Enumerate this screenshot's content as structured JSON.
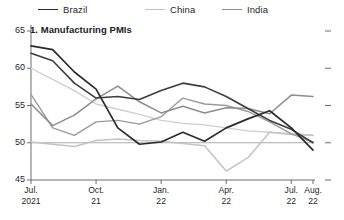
{
  "legend": {
    "items": [
      {
        "label": "Brazil",
        "color": "#2b2b2b",
        "x": 38
      },
      {
        "label": "China",
        "color": "#c3c3c3",
        "x": 145
      },
      {
        "label": "India",
        "color": "#8d8d8d",
        "x": 222
      }
    ]
  },
  "chart_data": {
    "type": "line",
    "title": "1. Manufacturing PMIs",
    "xlabel": "",
    "ylabel": "",
    "ylim": [
      45,
      65
    ],
    "yticks": [
      45,
      50,
      55,
      60,
      65
    ],
    "ytick_labels": [
      "45",
      "50",
      "55",
      "60",
      "65"
    ],
    "grid": false,
    "reference_line": 50,
    "legend_position": "top",
    "x": [
      "Jul. 2021",
      "Aug. 21",
      "Sep. 21",
      "Oct. 21",
      "Nov. 21",
      "Dec. 21",
      "Jan. 22",
      "Feb. 22",
      "Mar. 22",
      "Apr. 22",
      "May 22",
      "Jun. 22",
      "Jul. 22",
      "Aug. 22"
    ],
    "xtick_labels": [
      {
        "top": "Jul.",
        "bottom": "2021",
        "index": 0
      },
      {
        "top": "Oct.",
        "bottom": "21",
        "index": 3
      },
      {
        "top": "Jan.",
        "bottom": "22",
        "index": 6
      },
      {
        "top": "Apr.",
        "bottom": "22",
        "index": 9
      },
      {
        "top": "Jul.",
        "bottom": "22",
        "index": 12
      },
      {
        "top": "Aug.",
        "bottom": "22",
        "index": 13
      }
    ],
    "series": [
      {
        "name": "Brazil",
        "color": "#2b2b2b",
        "width": 1.7,
        "values": [
          63.0,
          62.5,
          59.5,
          57.2,
          52.0,
          49.8,
          50.1,
          51.4,
          50.2,
          52.0,
          53.2,
          54.3,
          52.0,
          49.0
        ]
      },
      {
        "name": "China",
        "color": "#c3c3c3",
        "width": 1.5,
        "values": [
          50.1,
          49.8,
          49.5,
          50.3,
          50.5,
          50.3,
          50.2,
          49.9,
          49.6,
          46.2,
          48.0,
          51.4,
          51.1,
          51.0
        ]
      },
      {
        "name": "India",
        "color": "#8d8d8d",
        "width": 1.5,
        "values": [
          55.2,
          52.3,
          53.7,
          55.9,
          57.6,
          55.5,
          54.0,
          54.9,
          54.0,
          54.7,
          54.6,
          53.9,
          56.4,
          56.2
        ]
      },
      {
        "name": "Brazil-alt",
        "color": "#3d3d3d",
        "width": 1.6,
        "values": [
          62.0,
          61.0,
          58.0,
          56.0,
          56.2,
          55.8,
          57.0,
          58.0,
          57.5,
          56.2,
          54.6,
          53.0,
          51.8,
          50.0
        ]
      },
      {
        "name": "India-alt",
        "color": "#9b9b9b",
        "width": 1.4,
        "values": [
          56.5,
          52.0,
          51.0,
          52.8,
          53.0,
          52.5,
          53.5,
          56.0,
          55.2,
          55.0,
          54.2,
          52.8,
          51.2,
          50.1
        ]
      },
      {
        "name": "China-alt",
        "color": "#cfcfcf",
        "width": 1.4,
        "values": [
          60.0,
          58.5,
          57.0,
          55.2,
          54.5,
          53.8,
          53.0,
          52.6,
          52.4,
          52.0,
          51.6,
          51.4,
          51.2,
          51.0
        ]
      }
    ]
  }
}
